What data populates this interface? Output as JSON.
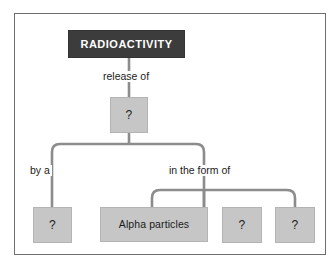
{
  "diagram": {
    "title": "RADIOACTIVITY",
    "type": "concept-map",
    "root": {
      "id": "radioactivity",
      "label": "RADIOACTIVITY",
      "style": "dark"
    },
    "edge_labels": {
      "release_of": "release of",
      "by_a": "by a",
      "in_the_form_of": "in the form of"
    },
    "nodes": {
      "release_blank": "?",
      "by_a_blank": "?",
      "alpha_particles": "Alpha particles",
      "form_blank_2": "?",
      "form_blank_3": "?"
    },
    "colors": {
      "root_fill": "#3c3c3c",
      "root_text": "#ffffff",
      "node_fill": "#c6c6c6",
      "node_text": "#1b1b1b",
      "connector": "#8c8c8c",
      "frame_border": "#6e6e6e",
      "page_background": "#ffffff"
    }
  }
}
